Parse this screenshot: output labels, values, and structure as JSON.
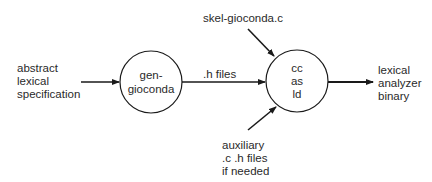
{
  "diagram": {
    "inputs": {
      "abstract_spec": [
        "abstract",
        "lexical",
        "specification"
      ],
      "skeleton": "skel-gioconda.c",
      "auxiliary": [
        "auxiliary",
        ".c .h files",
        "if needed"
      ]
    },
    "nodes": {
      "generator": [
        "gen-",
        "gioconda"
      ],
      "compiler": [
        "cc",
        "as",
        "ld"
      ]
    },
    "edges": {
      "intermediate": ".h files"
    },
    "output": [
      "lexical",
      "analyzer",
      "binary"
    ],
    "colors": {
      "stroke": "#1a1a1a",
      "text": "#2a2a2a",
      "background": "#ffffff"
    }
  }
}
